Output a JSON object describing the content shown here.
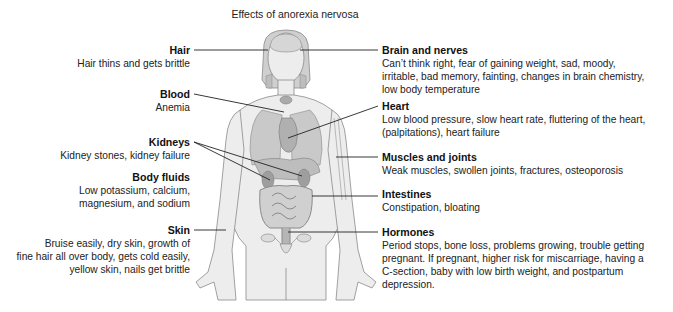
{
  "title": "Effects of anorexia nervosa",
  "left_labels": [
    {
      "heading": "Hair",
      "lines": [
        "Hair thins and gets brittle"
      ]
    },
    {
      "heading": "Blood",
      "lines": [
        "Anemia"
      ]
    },
    {
      "heading": "Kidneys",
      "lines": [
        "Kidney stones, kidney failure"
      ]
    },
    {
      "heading": "Body fluids",
      "lines": [
        "Low potassium, calcium,",
        "magnesium, and sodium"
      ]
    },
    {
      "heading": "Skin",
      "lines": [
        "Bruise easily, dry skin, growth of",
        "fine hair all over body, gets cold easily,",
        "yellow skin, nails get brittle"
      ]
    }
  ],
  "right_labels": [
    {
      "heading": "Brain and nerves",
      "lines": [
        "Can’t think right, fear of gaining weight, sad, moody,",
        "irritable, bad memory, fainting, changes in brain chemistry,",
        "low body temperature"
      ]
    },
    {
      "heading": "Heart",
      "lines": [
        "Low blood pressure, slow heart rate, fluttering of the heart,",
        "(palpitations), heart failure"
      ]
    },
    {
      "heading": "Muscles and joints",
      "lines": [
        "Weak muscles, swollen joints, fractures, osteoporosis"
      ]
    },
    {
      "heading": "Intestines",
      "lines": [
        "Constipation, bloating"
      ]
    },
    {
      "heading": "Hormones",
      "lines": [
        "Period stops, bone loss, problems growing, trouble getting",
        "pregnant. If pregnant, higher risk for miscarriage, having a",
        "C-section, baby with low birth weight, and postpartum",
        "depression."
      ]
    }
  ],
  "colors": {
    "text": "#1a1a1a",
    "leader_line": "#222222",
    "skin": "#ececec",
    "outline": "#8a8a8a",
    "organ": "#b5b5b5"
  }
}
